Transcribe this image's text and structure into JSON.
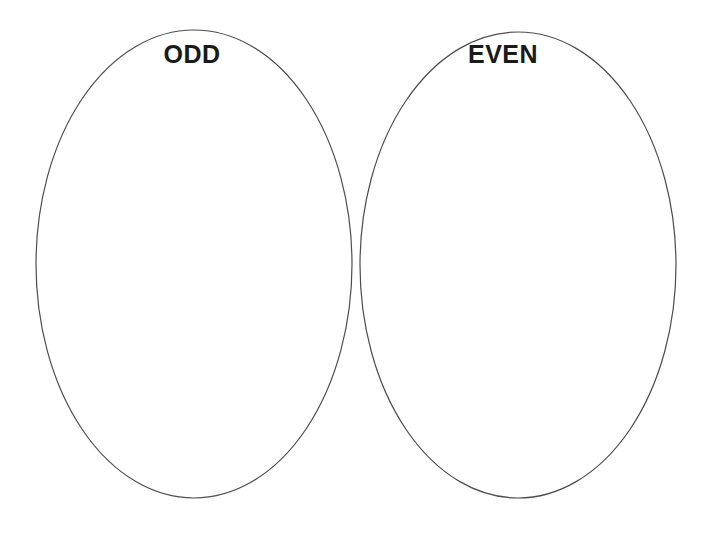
{
  "worksheet": {
    "left_oval": {
      "label": "ODD"
    },
    "right_oval": {
      "label": "EVEN"
    },
    "colors": {
      "background": "#ffffff",
      "oval_stroke": "#4d4d4d",
      "label_text": "#1a1a1a"
    }
  }
}
